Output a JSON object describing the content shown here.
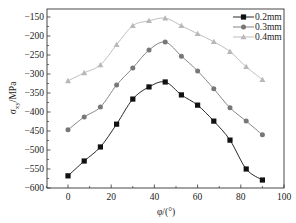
{
  "chart_data": {
    "type": "line",
    "title": "",
    "xlabel": "φ/(°)",
    "ylabel": "σxy/MPa",
    "ylabel_main": "σ",
    "ylabel_sub": "xy",
    "ylabel_unit": "/MPa",
    "xlim": [
      -10,
      100
    ],
    "ylim": [
      -600,
      -140
    ],
    "xticks": [
      0,
      20,
      40,
      60,
      80,
      100
    ],
    "yticks": [
      -150,
      -200,
      -250,
      -300,
      -350,
      -400,
      -450,
      -500,
      -550,
      -600
    ],
    "grid": false,
    "legend_position": "upper right",
    "x": [
      0,
      7.5,
      15,
      22.5,
      30,
      37.5,
      45,
      52.5,
      60,
      67.5,
      75,
      82.5,
      90
    ],
    "series": [
      {
        "name": "0.2mm",
        "marker": "square",
        "color": "#111111",
        "values": [
          -568,
          -529,
          -492,
          -432,
          -366,
          -334,
          -321,
          -355,
          -382,
          -424,
          -474,
          -550,
          -579
        ]
      },
      {
        "name": "0.3mm",
        "marker": "circle",
        "color": "#777777",
        "values": [
          -447,
          -413,
          -387,
          -329,
          -284,
          -237,
          -216,
          -253,
          -292,
          -339,
          -389,
          -424,
          -460
        ]
      },
      {
        "name": "0.4mm",
        "marker": "triangle",
        "color": "#b8b8b8",
        "values": [
          -318,
          -297,
          -276,
          -223,
          -173,
          -160,
          -153,
          -173,
          -194,
          -215,
          -241,
          -281,
          -315
        ]
      }
    ]
  }
}
